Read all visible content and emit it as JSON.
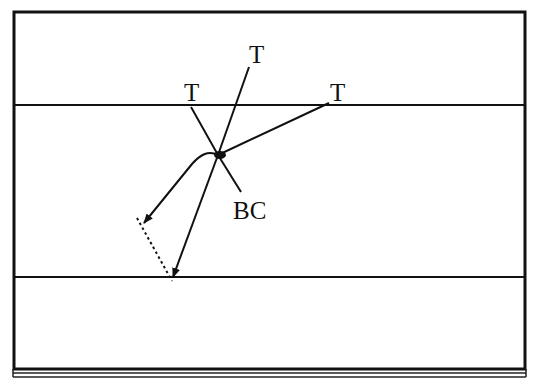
{
  "figure": {
    "type": "schematic",
    "background": "#ffffff",
    "stroke": "#111111",
    "frame": {
      "x": 14,
      "y": 12,
      "width": 511,
      "height": 357
    },
    "base_strip": {
      "y1": 373,
      "y2": 377
    },
    "boundaries": [
      {
        "name": "upper-boundary",
        "y": 105
      },
      {
        "name": "lower-boundary",
        "y": 277
      }
    ],
    "node": {
      "x": 218,
      "y": 155
    },
    "labels": {
      "top": "T",
      "left": "T",
      "right": "T",
      "stub": "BC"
    }
  }
}
